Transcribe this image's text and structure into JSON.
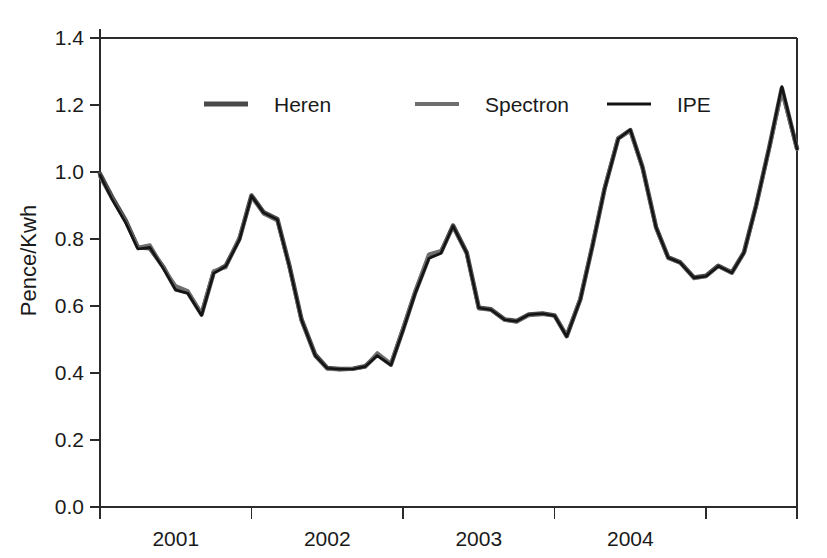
{
  "chart_data": {
    "type": "line",
    "title": "",
    "xlabel": "",
    "ylabel": "Pence/Kwh",
    "ylim": [
      0.0,
      1.4
    ],
    "xlim": [
      2000.5,
      2005.1
    ],
    "grid": false,
    "legend_position": "top-center-inside",
    "y_ticks": [
      "0.0",
      "0.2",
      "0.4",
      "0.6",
      "0.8",
      "1.0",
      "1.2",
      "1.4"
    ],
    "y_tick_values": [
      0.0,
      0.2,
      0.4,
      0.6,
      0.8,
      1.0,
      1.2,
      1.4
    ],
    "x_tick_labels": [
      "2001",
      "2002",
      "2003",
      "2004"
    ],
    "x_tick_label_values": [
      2001.0,
      2002.0,
      2003.0,
      2004.0
    ],
    "x_tick_boundaries": [
      2000.5,
      2001.5,
      2002.5,
      2003.5,
      2004.5,
      2005.1
    ],
    "x": [
      2000.5,
      2000.58,
      2000.67,
      2000.75,
      2000.83,
      2000.92,
      2001.0,
      2001.08,
      2001.17,
      2001.25,
      2001.33,
      2001.42,
      2001.5,
      2001.58,
      2001.67,
      2001.75,
      2001.83,
      2001.92,
      2002.0,
      2002.08,
      2002.17,
      2002.25,
      2002.33,
      2002.42,
      2002.5,
      2002.58,
      2002.67,
      2002.75,
      2002.83,
      2002.92,
      2003.0,
      2003.08,
      2003.17,
      2003.25,
      2003.33,
      2003.42,
      2003.5,
      2003.58,
      2003.67,
      2003.75,
      2003.83,
      2003.92,
      2004.0,
      2004.08,
      2004.17,
      2004.25,
      2004.33,
      2004.42,
      2004.5,
      2004.58,
      2004.67,
      2004.75,
      2004.83,
      2004.92,
      2005.0,
      2005.1
    ],
    "series": [
      {
        "name": "Heren",
        "color": "#4a4a4a",
        "linewidth": 4.5,
        "values": [
          0.995,
          0.925,
          0.855,
          0.775,
          0.772,
          0.715,
          0.65,
          0.64,
          0.575,
          0.7,
          0.72,
          0.8,
          0.93,
          0.88,
          0.86,
          0.72,
          0.56,
          0.455,
          0.415,
          0.412,
          0.413,
          0.42,
          0.455,
          0.425,
          0.53,
          0.64,
          0.745,
          0.76,
          0.84,
          0.76,
          0.595,
          0.59,
          0.56,
          0.555,
          0.575,
          0.578,
          0.572,
          0.51,
          0.62,
          0.78,
          0.95,
          1.1,
          1.125,
          1.015,
          0.835,
          0.745,
          0.73,
          0.685,
          0.69,
          0.72,
          0.7,
          0.76,
          0.9,
          1.08,
          1.25,
          1.07
        ]
      },
      {
        "name": "Spectron",
        "color": "#6e6e6e",
        "linewidth": 3.5,
        "values": [
          0.985,
          0.92,
          0.85,
          0.775,
          0.782,
          0.712,
          0.66,
          0.645,
          0.578,
          0.705,
          0.715,
          0.805,
          0.925,
          0.875,
          0.855,
          0.715,
          0.555,
          0.45,
          0.412,
          0.41,
          0.412,
          0.418,
          0.46,
          0.428,
          0.535,
          0.645,
          0.755,
          0.765,
          0.835,
          0.755,
          0.592,
          0.588,
          0.558,
          0.552,
          0.572,
          0.575,
          0.57,
          0.512,
          0.622,
          0.782,
          0.952,
          1.102,
          1.122,
          1.012,
          0.832,
          0.742,
          0.728,
          0.682,
          0.688,
          0.718,
          0.698,
          0.758,
          0.898,
          1.078,
          1.24,
          1.068
        ]
      },
      {
        "name": "IPE",
        "color": "#141414",
        "linewidth": 2.6,
        "values": [
          0.99,
          0.918,
          0.848,
          0.77,
          0.775,
          0.71,
          0.648,
          0.638,
          0.572,
          0.698,
          0.718,
          0.798,
          0.928,
          0.878,
          0.858,
          0.718,
          0.558,
          0.452,
          0.414,
          0.411,
          0.412,
          0.419,
          0.452,
          0.424,
          0.528,
          0.638,
          0.742,
          0.758,
          0.838,
          0.758,
          0.594,
          0.589,
          0.559,
          0.554,
          0.574,
          0.577,
          0.571,
          0.509,
          0.619,
          0.779,
          0.949,
          1.099,
          1.126,
          1.014,
          0.834,
          0.744,
          0.729,
          0.684,
          0.689,
          0.719,
          0.699,
          0.759,
          0.899,
          1.079,
          1.255,
          1.069
        ]
      }
    ]
  },
  "legend": {
    "items": [
      {
        "label": "Heren"
      },
      {
        "label": "Spectron"
      },
      {
        "label": "IPE"
      }
    ]
  },
  "axes": {
    "y_title": "Pence/Kwh"
  }
}
